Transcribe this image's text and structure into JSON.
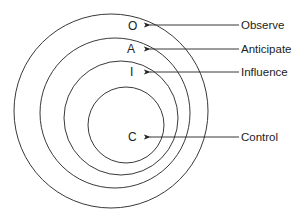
{
  "diagram": {
    "type": "nested-circles",
    "circles": [
      {
        "id": "observe",
        "letter": "O",
        "label": "Observe",
        "cx": 111,
        "cy": 111,
        "r": 97
      },
      {
        "id": "anticipate",
        "letter": "A",
        "label": "Anticipate",
        "cx": 115,
        "cy": 113,
        "r": 75
      },
      {
        "id": "influence",
        "letter": "I",
        "label": "Influence",
        "cx": 121,
        "cy": 118,
        "r": 57
      },
      {
        "id": "control",
        "letter": "C",
        "label": "Control",
        "cx": 126,
        "cy": 125,
        "r": 38
      }
    ],
    "letters": {
      "O": "O",
      "A": "A",
      "I": "I",
      "C": "C"
    },
    "labels": {
      "observe": "Observe",
      "anticipate": "Anticipate",
      "influence": "Influence",
      "control": "Control"
    },
    "colors": {
      "stroke": "#222222",
      "background": "#ffffff"
    }
  }
}
